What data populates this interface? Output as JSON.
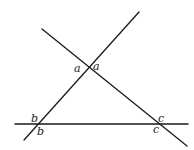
{
  "diagram": {
    "type": "geometry",
    "lines": [
      {
        "name": "rising-line",
        "x1": 24,
        "y1": 140,
        "x2": 139,
        "y2": 12
      },
      {
        "name": "falling-line",
        "x1": 42,
        "y1": 29,
        "x2": 187,
        "y2": 146
      },
      {
        "name": "horizontal-line",
        "x1": 15,
        "y1": 124,
        "x2": 188,
        "y2": 124
      }
    ],
    "labels": [
      {
        "text": "a",
        "x": 74,
        "y": 72
      },
      {
        "text": "a",
        "x": 93,
        "y": 70
      },
      {
        "text": "b",
        "x": 31,
        "y": 122
      },
      {
        "text": "b",
        "x": 37,
        "y": 135
      },
      {
        "text": "c",
        "x": 158,
        "y": 122
      },
      {
        "text": "c",
        "x": 153,
        "y": 133
      }
    ]
  }
}
